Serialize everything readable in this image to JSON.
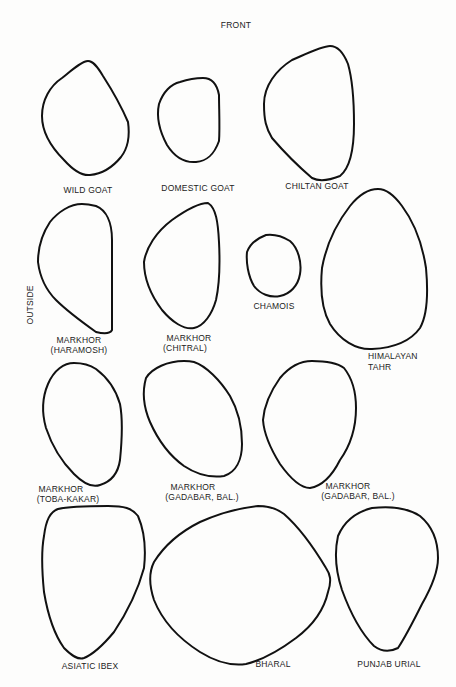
{
  "orientation": {
    "top_label": "FRONT",
    "side_label": "OUTSIDE"
  },
  "specimens": [
    {
      "name": "wild-goat",
      "label_lines": [
        "WILD GOAT"
      ]
    },
    {
      "name": "domestic-goat",
      "label_lines": [
        "DOMESTIC GOAT"
      ]
    },
    {
      "name": "chiltan-goat",
      "label_lines": [
        "CHILTAN GOAT"
      ]
    },
    {
      "name": "markhor-haramosh",
      "label_lines": [
        "MARKHOR",
        "(HARAMOSH)"
      ]
    },
    {
      "name": "markhor-chitral",
      "label_lines": [
        "MARKHOR",
        "(CHITRAL)"
      ]
    },
    {
      "name": "chamois",
      "label_lines": [
        "CHAMOIS"
      ]
    },
    {
      "name": "himalayan-tahr",
      "label_lines": [
        "HIMALAYAN",
        "TAHR"
      ]
    },
    {
      "name": "markhor-toba-kakar",
      "label_lines": [
        "MARKHOR",
        "(TOBA-KAKAR)"
      ]
    },
    {
      "name": "markhor-gadabar-1",
      "label_lines": [
        "MARKHOR",
        "(GADABAR, BAL.)"
      ]
    },
    {
      "name": "markhor-gadabar-2",
      "label_lines": [
        "MARKHOR",
        "(GADABAR, BAL.)"
      ]
    },
    {
      "name": "asiatic-ibex",
      "label_lines": [
        "ASIATIC IBEX"
      ]
    },
    {
      "name": "bharal",
      "label_lines": [
        "BHARAL"
      ]
    },
    {
      "name": "punjab-urial",
      "label_lines": [
        "PUNJAB URIAL"
      ]
    }
  ],
  "style": {
    "stroke_color": "#111111",
    "background": "#fdfdfc"
  }
}
